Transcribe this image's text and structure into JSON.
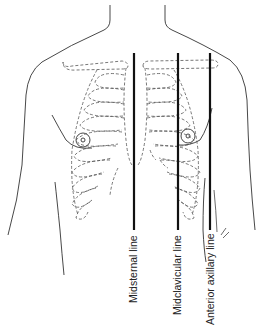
{
  "figure": {
    "colors": {
      "outline": "#333333",
      "dashed_ribs": "#555555",
      "reference_line": "#111111",
      "label_text": "#222222"
    },
    "labels": [
      {
        "id": "midsternal",
        "text": "Midsternal line"
      },
      {
        "id": "midclavicular",
        "text": "Midclavicular line"
      },
      {
        "id": "anterior-axillary",
        "text": "Anterior axillary line"
      }
    ]
  }
}
